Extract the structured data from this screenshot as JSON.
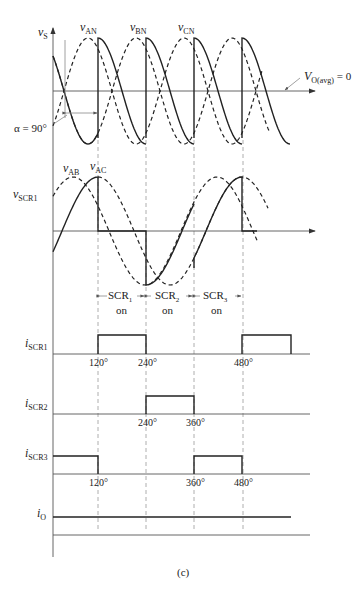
{
  "figure": {
    "caption": "(c)",
    "guide_angles": [
      "120°",
      "240°",
      "360°",
      "480°"
    ],
    "guide_x": [
      98,
      146,
      194,
      242
    ]
  },
  "top_plot": {
    "y_label_main": "v",
    "y_label_sub": "S",
    "phase_labels": [
      {
        "main": "v",
        "sub": "AN"
      },
      {
        "main": "v",
        "sub": "BN"
      },
      {
        "main": "v",
        "sub": "CN"
      }
    ],
    "alpha_label": "α = 90°",
    "avg_label_main": "V",
    "avg_label_sub": "O(avg)",
    "avg_label_value": " = 0"
  },
  "scr_voltage_plot": {
    "y_label_main": "v",
    "y_label_sub": "SCR1",
    "curve_labels": [
      {
        "main": "v",
        "sub": "AB"
      },
      {
        "main": "v",
        "sub": "AC"
      }
    ],
    "conduction_intervals": [
      {
        "main": "SCR",
        "sub": "1",
        "state": "on"
      },
      {
        "main": "SCR",
        "sub": "2",
        "state": "on"
      },
      {
        "main": "SCR",
        "sub": "3",
        "state": "on"
      }
    ]
  },
  "current_plots": [
    {
      "main": "i",
      "sub": "SCR1",
      "ticks": [
        "120°",
        "240°",
        "480°"
      ],
      "pulses": [
        [
          120,
          240
        ],
        [
          480,
          600
        ]
      ]
    },
    {
      "main": "i",
      "sub": "SCR2",
      "ticks": [
        "240°",
        "360°"
      ],
      "pulses": [
        [
          240,
          360
        ]
      ]
    },
    {
      "main": "i",
      "sub": "SCR3",
      "ticks": [
        "120°",
        "360°",
        "480°"
      ],
      "pulses": [
        [
          0,
          120
        ],
        [
          360,
          480
        ]
      ]
    },
    {
      "main": "i",
      "sub": "O",
      "ticks": [],
      "pulses": [
        [
          0,
          600
        ]
      ]
    }
  ]
}
